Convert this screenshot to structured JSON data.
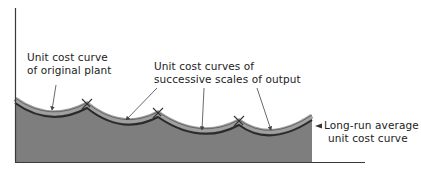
{
  "diagram": {
    "type": "long-run average cost envelope",
    "colors": {
      "fill": "#7e7e7e",
      "band": "#9a9a9a",
      "curve": "#2a2a2a",
      "axis": "#3a3a3a",
      "arrow": "#444444",
      "text": "#222222"
    },
    "labels": {
      "original_plant_line1": "Unit cost curve",
      "original_plant_line2": "of original plant",
      "successive_line1": "Unit cost curves of",
      "successive_line2": "successive scales of output",
      "long_run_line1": "Long-run average",
      "long_run_line2": "unit cost curve"
    }
  }
}
